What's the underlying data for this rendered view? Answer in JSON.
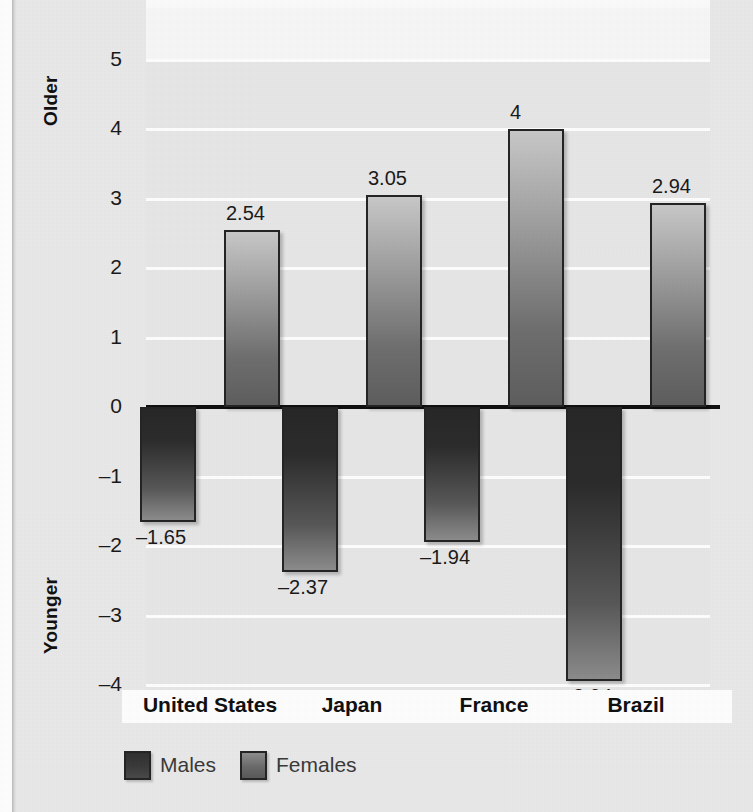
{
  "axis": {
    "top_label": "Older",
    "bottom_label": "Younger",
    "ticks": [
      "5",
      "4",
      "3",
      "2",
      "1",
      "0",
      "–1",
      "–2",
      "–3",
      "–4"
    ]
  },
  "legend": {
    "items": [
      {
        "label": "Males",
        "swatch": "males"
      },
      {
        "label": "Females",
        "swatch": "females"
      }
    ]
  },
  "categories": [
    "United States",
    "Japan",
    "France",
    "Brazil"
  ],
  "bar_labels": {
    "us_males": "–1.65",
    "us_females": "2.54",
    "jp_males": "–2.37",
    "jp_females": "3.05",
    "fr_males": "–1.94",
    "fr_females": "4",
    "br_males": "–3.94",
    "br_females": "2.94"
  },
  "chart_data": {
    "type": "bar",
    "title": "",
    "xlabel": "",
    "ylabel": "",
    "ylim": [
      -4,
      5
    ],
    "yticks": [
      -4,
      -3,
      -2,
      -1,
      0,
      1,
      2,
      3,
      4,
      5
    ],
    "grid": true,
    "legend_position": "bottom-left",
    "axis_top_annotation": "Older",
    "axis_bottom_annotation": "Younger",
    "categories": [
      "United States",
      "Japan",
      "France",
      "Brazil"
    ],
    "series": [
      {
        "name": "Males",
        "values": [
          -1.65,
          -2.37,
          -1.94,
          -3.94
        ],
        "labels": [
          "–1.65",
          "–2.37",
          "–1.94",
          "–3.94"
        ],
        "color": "#2c2c2c"
      },
      {
        "name": "Females",
        "values": [
          2.54,
          3.05,
          4.0,
          2.94
        ],
        "labels": [
          "2.54",
          "3.05",
          "4",
          "2.94"
        ],
        "color": "#8a8a8a"
      }
    ]
  }
}
